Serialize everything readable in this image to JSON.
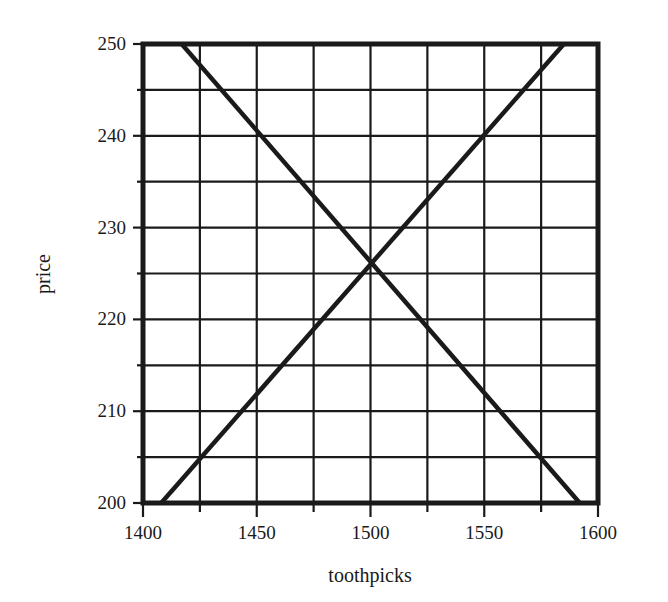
{
  "chart_data": {
    "type": "line",
    "title": "",
    "xlabel": "toothpicks",
    "ylabel": "price",
    "xlim": [
      1400,
      1600
    ],
    "ylim": [
      200,
      250
    ],
    "x_ticks": [
      1400,
      1450,
      1500,
      1550,
      1600
    ],
    "x_tick_labels": [
      "1400",
      "1450",
      "1500",
      "1550",
      "1600"
    ],
    "y_ticks": [
      200,
      210,
      220,
      230,
      240,
      250
    ],
    "y_tick_labels": [
      "200",
      "210",
      "220",
      "230",
      "240",
      "250"
    ],
    "x_minor_step": 25,
    "y_minor_step": 5,
    "grid": true,
    "legend": null,
    "series": [
      {
        "name": "demand (downward-sloping line)",
        "x": [
          1417,
          1592
        ],
        "y": [
          250,
          200
        ]
      },
      {
        "name": "supply (upward-sloping line)",
        "x": [
          1408,
          1585
        ],
        "y": [
          200,
          250
        ]
      }
    ],
    "annotations": [
      {
        "text": "intersection",
        "x": 1500,
        "y": 225
      }
    ],
    "colors": {
      "lines": "#1a1a1a",
      "grid": "#1a1a1a",
      "background": "#ffffff"
    }
  }
}
